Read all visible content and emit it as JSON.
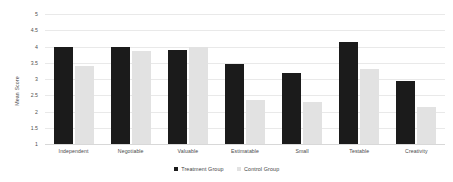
{
  "chart_data": {
    "type": "bar",
    "title": "",
    "subtitle": "",
    "xlabel": "",
    "ylabel": "Mean Score",
    "ylim": [
      1,
      5
    ],
    "ytick_step": 0.5,
    "yticks": [
      "5",
      "4.5",
      "4",
      "3.5",
      "3",
      "2.5",
      "2",
      "1.5",
      "1"
    ],
    "grid": true,
    "legend_position": "bottom-center",
    "categories": [
      "Independent",
      "Negotiable",
      "Valuable",
      "Estimatable",
      "Small",
      "Testable",
      "Creativity"
    ],
    "series": [
      {
        "name": "Treatment Group",
        "color": "#1b1b1b",
        "values": [
          4.0,
          3.98,
          3.9,
          3.45,
          3.2,
          4.15,
          2.95
        ]
      },
      {
        "name": "Control Group",
        "color": "#e2e2e2",
        "values": [
          3.4,
          3.85,
          4.0,
          2.35,
          2.3,
          3.3,
          2.15
        ]
      }
    ]
  },
  "legend": {
    "items": [
      {
        "label": "Treatment Group",
        "swatch": "treatment"
      },
      {
        "label": "Control Group",
        "swatch": "control"
      }
    ]
  },
  "colors": {
    "treatment": "#1b1b1b",
    "control": "#e2e2e2",
    "gridline": "#e9e9e9",
    "axis_text": "#4a4a4a",
    "background": "#ffffff"
  }
}
